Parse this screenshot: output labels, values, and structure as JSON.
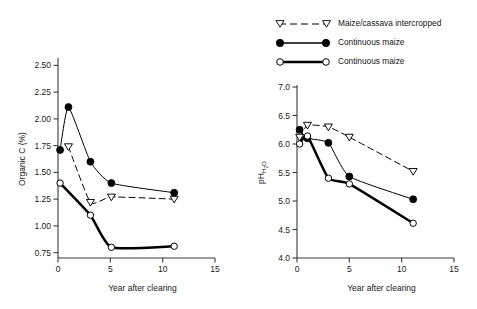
{
  "legend": {
    "items": [
      {
        "label": "Maize/cassava intercropped",
        "marker": "open-triangle-down",
        "line": "dashed",
        "width": 1.0,
        "color": "#000000",
        "name": "maize-cassava-intercropped"
      },
      {
        "label": "Continuous maize",
        "marker": "filled-circle",
        "line": "solid",
        "width": 1.1,
        "color": "#000000",
        "name": "continuous-maize-filled"
      },
      {
        "label": "Continuous maize",
        "marker": "open-circle",
        "line": "solid-thick",
        "width": 2.4,
        "color": "#000000",
        "name": "continuous-maize-open"
      }
    ]
  },
  "chart_data": [
    {
      "id": "organic-carbon",
      "type": "line",
      "title": "",
      "xlabel": "Year after clearing",
      "ylabel": "Organic C (%)",
      "xlim": [
        0,
        15
      ],
      "ylim": [
        0.7,
        2.55
      ],
      "xticks": [
        0,
        5,
        10,
        15
      ],
      "xticklabels": [
        "0",
        "5",
        "10",
        "15"
      ],
      "yticks": [
        0.75,
        1.0,
        1.25,
        1.5,
        1.75,
        2.0,
        2.25,
        2.5
      ],
      "yticklabels": [
        "0.75",
        "1.00",
        "1.25",
        "1.50",
        "1.75",
        "2.00",
        "2.25",
        "2.50"
      ],
      "grid": false,
      "legend_position": "external-top-right",
      "series": [
        {
          "name": "Maize/cassava intercropped",
          "marker": "open-triangle-down",
          "line": "dashed",
          "x": [
            1.0,
            3.1,
            5.1,
            11.1
          ],
          "y": [
            1.74,
            1.22,
            1.27,
            1.25
          ]
        },
        {
          "name": "Continuous maize",
          "marker": "filled-circle",
          "line": "solid",
          "x": [
            0.2,
            1.0,
            3.1,
            5.1,
            11.1
          ],
          "y": [
            1.71,
            2.11,
            1.6,
            1.4,
            1.31
          ]
        },
        {
          "name": "Continuous maize",
          "marker": "open-circle",
          "line": "solid-thick",
          "x": [
            0.2,
            3.1,
            5.1,
            11.1
          ],
          "y": [
            1.4,
            1.1,
            0.8,
            0.81
          ]
        }
      ]
    },
    {
      "id": "ph-water",
      "type": "line",
      "title": "",
      "xlabel": "Year after clearing",
      "ylabel": "pH H2O",
      "xlim": [
        0,
        15
      ],
      "ylim": [
        4.0,
        7.0
      ],
      "xticks": [
        0,
        5,
        10,
        15
      ],
      "xticklabels": [
        "0",
        "5",
        "10",
        "15"
      ],
      "yticks": [
        4.0,
        4.5,
        5.0,
        5.5,
        6.0,
        6.5,
        7.0
      ],
      "yticklabels": [
        "4.0",
        "4.5",
        "5.0",
        "5.5",
        "6.0",
        "6.5",
        "7.0"
      ],
      "grid": false,
      "legend_position": "external-top-right",
      "series": [
        {
          "name": "Maize/cassava intercropped",
          "marker": "open-triangle-down",
          "line": "dashed",
          "x": [
            0.25,
            1.0,
            3.0,
            5.0,
            11.1
          ],
          "y": [
            6.12,
            6.33,
            6.3,
            6.12,
            5.52
          ]
        },
        {
          "name": "Continuous maize",
          "marker": "filled-circle",
          "line": "solid",
          "x": [
            0.25,
            1.0,
            3.0,
            5.0,
            11.1
          ],
          "y": [
            6.25,
            6.1,
            6.02,
            5.43,
            5.03
          ]
        },
        {
          "name": "Continuous maize",
          "marker": "open-circle",
          "line": "solid-thick",
          "x": [
            0.25,
            1.0,
            3.0,
            5.0,
            11.1
          ],
          "y": [
            6.0,
            6.14,
            5.4,
            5.3,
            4.61
          ]
        }
      ]
    }
  ]
}
